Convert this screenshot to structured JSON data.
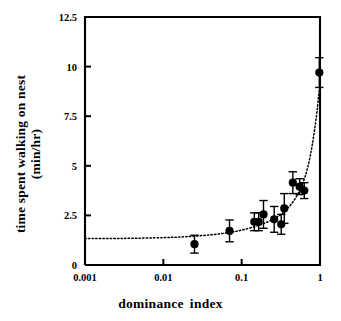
{
  "chart_data": {
    "type": "scatter",
    "title": "",
    "xlabel": "dominance  index",
    "xlabel_words": [
      "dominance",
      "index"
    ],
    "ylabel": "time spent walking on nest (min/hr)",
    "ylabel_lines": [
      "time spent walking on nest",
      "(min/hr)"
    ],
    "xscale": "log",
    "yscale": "linear",
    "xlim": [
      0.001,
      1
    ],
    "ylim": [
      0,
      12.5
    ],
    "xticks": [
      0.001,
      0.01,
      0.1,
      1
    ],
    "xticklabels": [
      "0.001",
      "0.01",
      "0.1",
      "1"
    ],
    "yticks": [
      0,
      2.5,
      5,
      7.5,
      10,
      12.5
    ],
    "yticklabels": [
      "0",
      "2.5",
      "5",
      "7.5",
      "10",
      "12.5"
    ],
    "grid": false,
    "legend": "none",
    "marker": "filled-circle",
    "marker_color": "#000000",
    "errorbar_color": "#000000",
    "errorbars": "vertical",
    "fit_curve": {
      "style": "dotted",
      "color": "#000000",
      "description": "dotted fitted curve, flat near y=1.35 at low dominance index, rising steeply toward y=9 near x=1",
      "points": [
        {
          "x": 0.001,
          "y": 1.33
        },
        {
          "x": 0.003,
          "y": 1.34
        },
        {
          "x": 0.01,
          "y": 1.38
        },
        {
          "x": 0.02,
          "y": 1.43
        },
        {
          "x": 0.04,
          "y": 1.52
        },
        {
          "x": 0.07,
          "y": 1.64
        },
        {
          "x": 0.1,
          "y": 1.76
        },
        {
          "x": 0.15,
          "y": 1.95
        },
        {
          "x": 0.2,
          "y": 2.12
        },
        {
          "x": 0.3,
          "y": 2.48
        },
        {
          "x": 0.4,
          "y": 2.92
        },
        {
          "x": 0.5,
          "y": 3.45
        },
        {
          "x": 0.6,
          "y": 4.1
        },
        {
          "x": 0.7,
          "y": 4.95
        },
        {
          "x": 0.8,
          "y": 6.1
        },
        {
          "x": 0.9,
          "y": 7.5
        },
        {
          "x": 0.96,
          "y": 8.5
        },
        {
          "x": 1.0,
          "y": 9.15
        }
      ]
    },
    "points": [
      {
        "x": 0.025,
        "y": 1.05,
        "yerr_low": 0.45,
        "yerr_high": 0.45
      },
      {
        "x": 0.07,
        "y": 1.72,
        "yerr_low": 0.55,
        "yerr_high": 0.55
      },
      {
        "x": 0.145,
        "y": 2.18,
        "yerr_low": 0.45,
        "yerr_high": 0.45
      },
      {
        "x": 0.165,
        "y": 2.18,
        "yerr_low": 0.45,
        "yerr_high": 0.45
      },
      {
        "x": 0.19,
        "y": 2.55,
        "yerr_low": 0.7,
        "yerr_high": 0.7
      },
      {
        "x": 0.26,
        "y": 2.3,
        "yerr_low": 0.65,
        "yerr_high": 0.65
      },
      {
        "x": 0.32,
        "y": 2.05,
        "yerr_low": 0.5,
        "yerr_high": 0.5
      },
      {
        "x": 0.35,
        "y": 2.85,
        "yerr_low": 0.75,
        "yerr_high": 0.75
      },
      {
        "x": 0.45,
        "y": 4.15,
        "yerr_low": 0.55,
        "yerr_high": 0.55
      },
      {
        "x": 0.55,
        "y": 3.95,
        "yerr_low": 0.4,
        "yerr_high": 0.4
      },
      {
        "x": 0.63,
        "y": 3.75,
        "yerr_low": 0.4,
        "yerr_high": 0.4
      },
      {
        "x": 0.98,
        "y": 9.7,
        "yerr_low": 0.75,
        "yerr_high": 0.75
      }
    ]
  }
}
